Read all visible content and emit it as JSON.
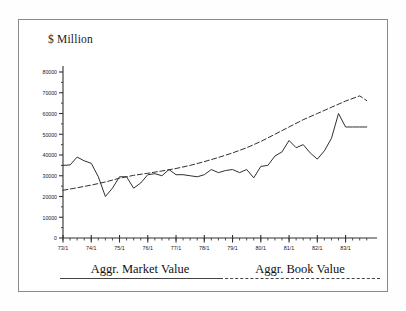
{
  "figure": {
    "axis_title": "$ Million",
    "frame_color": "#8a8a8a",
    "background": "#ffffff",
    "line_color": "#303030"
  },
  "legend": {
    "position": "below-axis",
    "entries": [
      {
        "label": "Aggr. Market Value",
        "style": "solid",
        "color": "#444444"
      },
      {
        "label": "Aggr. Book Value",
        "style": "dashed",
        "color": "#444444"
      }
    ]
  },
  "chart_data": {
    "type": "line",
    "title": "",
    "subtitle": "",
    "xlabel": "",
    "ylabel": "$ Million",
    "grid": false,
    "legend_position": "bottom",
    "xlim": [
      1973.0,
      1983.9
    ],
    "ylim": [
      0,
      80000
    ],
    "ytick_labels": [
      "0",
      "10000",
      "20000",
      "30000",
      "40000",
      "50000",
      "60000",
      "70000",
      "80000"
    ],
    "yticks": [
      0,
      10000,
      20000,
      30000,
      40000,
      50000,
      60000,
      70000,
      80000
    ],
    "xtick_labels": [
      "73/1",
      "74/1",
      "75/1",
      "76/1",
      "77/1",
      "78/1",
      "79/1",
      "80/1",
      "81/1",
      "82/1",
      "83/1"
    ],
    "xticks": [
      1973,
      1974,
      1975,
      1976,
      1977,
      1978,
      1979,
      1980,
      1981,
      1982,
      1983
    ],
    "x_minor_tick_interval": 0.25,
    "series": [
      {
        "name": "Aggr. Market Value",
        "style": "solid",
        "x": [
          1973.0,
          1973.25,
          1973.5,
          1973.75,
          1974.0,
          1974.25,
          1974.5,
          1974.75,
          1975.0,
          1975.25,
          1975.5,
          1975.75,
          1976.0,
          1976.25,
          1976.5,
          1976.75,
          1977.0,
          1977.25,
          1977.5,
          1977.75,
          1978.0,
          1978.25,
          1978.5,
          1978.75,
          1979.0,
          1979.25,
          1979.5,
          1979.75,
          1980.0,
          1980.25,
          1980.5,
          1980.75,
          1981.0,
          1981.25,
          1981.5,
          1981.75,
          1982.0,
          1982.25,
          1982.5,
          1982.75,
          1983.0,
          1983.25,
          1983.5,
          1983.75
        ],
        "values": [
          35000,
          35200,
          39000,
          37200,
          36000,
          29500,
          20000,
          24000,
          29500,
          29500,
          24000,
          26500,
          30500,
          31000,
          30000,
          33000,
          30500,
          30500,
          30000,
          29500,
          30500,
          33000,
          31500,
          32500,
          33000,
          31500,
          33000,
          29000,
          34500,
          35000,
          39500,
          41500,
          47000,
          43500,
          45000,
          41000,
          38000,
          42000,
          48000,
          60000,
          53500,
          53500,
          53500,
          53500
        ]
      },
      {
        "name": "Aggr. Book Value",
        "style": "dashed",
        "x": [
          1973.0,
          1973.5,
          1974.0,
          1974.5,
          1975.0,
          1975.5,
          1976.0,
          1976.5,
          1977.0,
          1977.5,
          1978.0,
          1978.5,
          1979.0,
          1979.5,
          1980.0,
          1980.5,
          1981.0,
          1981.5,
          1982.0,
          1982.5,
          1983.0,
          1983.5,
          1983.75
        ],
        "values": [
          23000,
          24200,
          25500,
          27000,
          28800,
          30200,
          31200,
          32300,
          33500,
          35000,
          36800,
          38800,
          41000,
          43500,
          46500,
          50000,
          53500,
          57000,
          60000,
          63000,
          66000,
          68500,
          66200
        ]
      }
    ]
  }
}
